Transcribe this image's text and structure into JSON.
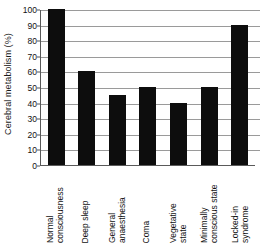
{
  "chart_data": {
    "type": "bar",
    "title": "",
    "xlabel": "",
    "ylabel": "Cerebral metabolism (%)",
    "ylim": [
      0,
      100
    ],
    "ytick_values": [
      0,
      10,
      20,
      30,
      40,
      50,
      60,
      70,
      80,
      90,
      100
    ],
    "ytick_labels": [
      "0",
      "10",
      "20",
      "30",
      "40",
      "50",
      "60",
      "70",
      "80",
      "90",
      "100"
    ],
    "grid": true,
    "grid_axis": "y",
    "legend": "none",
    "bar_color": "#0d0d0d",
    "categories": [
      "Normal consciousness",
      "Deep sleep",
      "General anaesthesia",
      "Coma",
      "Vegetative state",
      "Minimally conscious state",
      "Locked-in syndrome"
    ],
    "category_lines": [
      [
        "Normal",
        "consciousness"
      ],
      [
        "Deep sleep",
        ""
      ],
      [
        "General",
        "anaesthesia"
      ],
      [
        "Coma",
        ""
      ],
      [
        "Vegetative",
        "state"
      ],
      [
        "Minimally",
        "conscious state"
      ],
      [
        "Locked-in",
        "syndrome"
      ]
    ],
    "values": [
      100,
      60,
      45,
      50,
      40,
      50,
      90
    ]
  }
}
